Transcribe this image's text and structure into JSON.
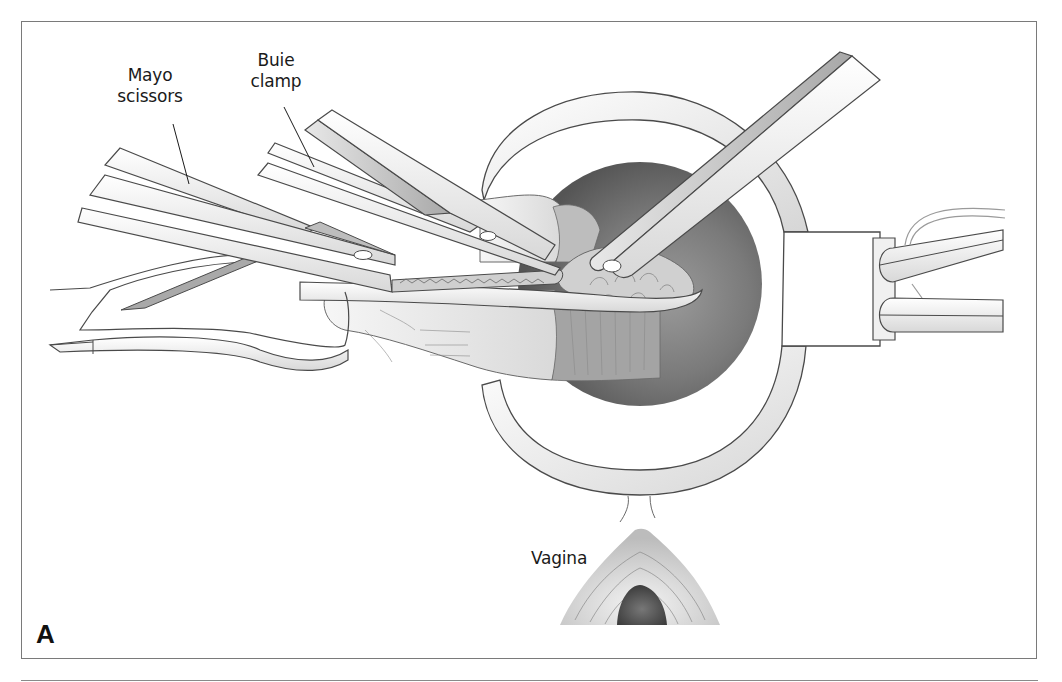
{
  "figure": {
    "panel_letter": "A",
    "labels": {
      "mayo_scissors": "Mayo\nscissors",
      "buie_clamp": "Buie\nclamp",
      "vagina": "Vagina"
    }
  },
  "colors": {
    "frame": "#7a7a7a",
    "outline": "#4a4a4a",
    "instrument_fill": "#f2f2f2",
    "instrument_shade": "#bdbdbd",
    "lumen_dark": "#5e5e5e",
    "lumen_mid": "#8c8c8c",
    "tissue": "#e6e6e6",
    "text": "#1a1a1a"
  }
}
